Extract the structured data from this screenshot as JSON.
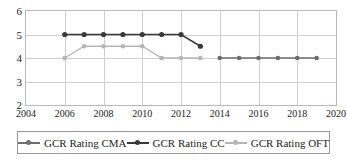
{
  "chart_data": {
    "type": "line",
    "title": "",
    "xlabel": "",
    "ylabel": "",
    "xlim": [
      2004,
      2020
    ],
    "ylim": [
      2,
      6
    ],
    "xticks": [
      2004,
      2006,
      2008,
      2010,
      2012,
      2014,
      2016,
      2018,
      2020
    ],
    "yticks": [
      2,
      3,
      4,
      5,
      6
    ],
    "grid": true,
    "legend_position": "bottom",
    "series": [
      {
        "name": "GCR Rating CMA",
        "color": "#6e6e6e",
        "x": [
          2014,
          2015,
          2016,
          2017,
          2018,
          2019
        ],
        "values": [
          4,
          4,
          4,
          4,
          4,
          4
        ]
      },
      {
        "name": "GCR Rating CC",
        "color": "#3a3a3a",
        "x": [
          2006,
          2007,
          2008,
          2009,
          2010,
          2011,
          2012,
          2013
        ],
        "values": [
          5,
          5,
          5,
          5,
          5,
          5,
          5,
          4.5
        ]
      },
      {
        "name": "GCR Rating OFT",
        "color": "#b5b5b5",
        "x": [
          2006,
          2007,
          2008,
          2009,
          2010,
          2011,
          2012,
          2013
        ],
        "values": [
          4,
          4.5,
          4.5,
          4.5,
          4.5,
          4,
          4,
          4
        ]
      }
    ]
  },
  "axes": {
    "y_tick_labels": [
      "6",
      "5",
      "4",
      "3",
      "2"
    ],
    "x_tick_labels": [
      "2004",
      "2006",
      "2008",
      "2010",
      "2012",
      "2014",
      "2016",
      "2018",
      "2020"
    ]
  },
  "legend": {
    "items": [
      {
        "label": "GCR Rating CMA",
        "color": "#6e6e6e",
        "marker": "circle"
      },
      {
        "label": "GCR Rating CC",
        "color": "#3a3a3a",
        "marker": "circle"
      },
      {
        "label": "GCR Rating OFT",
        "color": "#b5b5b5",
        "marker": "circle"
      }
    ]
  },
  "colors": {
    "grid": "#cfcfcf",
    "frame": "#b9b9b9",
    "text": "#1d1d1d",
    "background": "#ffffff"
  }
}
